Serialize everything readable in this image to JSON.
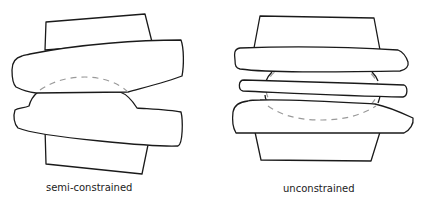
{
  "diagram": {
    "panels": [
      {
        "id": "semi-constrained",
        "label": "semi-constrained",
        "components": [
          "upper-block",
          "upper-plate",
          "dome-insert",
          "lower-plate",
          "lower-block",
          "dashed-arc"
        ]
      },
      {
        "id": "unconstrained",
        "label": "unconstrained",
        "components": [
          "upper-block",
          "upper-plate",
          "middle-insert",
          "lower-plate",
          "lower-block",
          "dashed-ellipse"
        ]
      }
    ],
    "colors": {
      "outline": "#1a1a1a",
      "dashed": "#9a9a9a",
      "fill": "#ffffff",
      "background": "#ffffff"
    }
  }
}
